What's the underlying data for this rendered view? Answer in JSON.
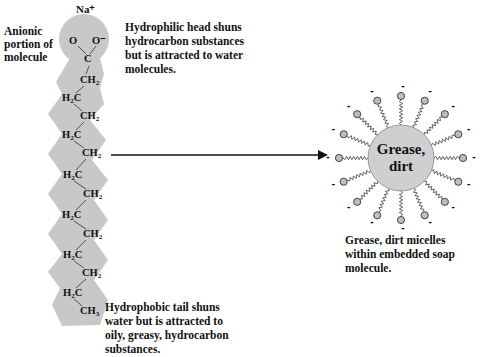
{
  "soap_molecule": {
    "cation": "Na⁺",
    "anionic_label": [
      "Anionic",
      "portion of",
      "molecule"
    ],
    "head_atoms": {
      "o_left": "O",
      "o_right": "O⁻",
      "carbon": "C"
    },
    "chain": [
      {
        "text": "CH",
        "sub": "2",
        "x": 80,
        "y": 74
      },
      {
        "text": "H",
        "sub": "2",
        "tail": "C",
        "x": 62,
        "y": 92
      },
      {
        "text": "CH",
        "sub": "2",
        "x": 80,
        "y": 110
      },
      {
        "text": "H",
        "sub": "2",
        "tail": "C",
        "x": 62,
        "y": 129
      },
      {
        "text": "CH",
        "sub": "2",
        "x": 82,
        "y": 147
      },
      {
        "text": "H",
        "sub": "2",
        "tail": "C",
        "x": 63,
        "y": 169
      },
      {
        "text": "CH",
        "sub": "2",
        "x": 83,
        "y": 188
      },
      {
        "text": "H",
        "sub": "2",
        "tail": "C",
        "x": 62,
        "y": 209
      },
      {
        "text": "CH",
        "sub": "2",
        "x": 83,
        "y": 228
      },
      {
        "text": "H",
        "sub": "2",
        "tail": "C",
        "x": 63,
        "y": 249
      },
      {
        "text": "CH",
        "sub": "2",
        "x": 82,
        "y": 267
      },
      {
        "text": "H",
        "sub": "2",
        "tail": "C",
        "x": 63,
        "y": 287
      },
      {
        "text": "CH",
        "sub": "3",
        "x": 80,
        "y": 305
      }
    ],
    "head_description": [
      "Hydrophilic head shuns",
      "hydrocarbon substances",
      "but is attracted to water",
      "molecules."
    ],
    "tail_description": [
      "Hydrophobic tail shuns",
      "water but is attracted to",
      "oily, greasy, hydrocarbon",
      "substances."
    ]
  },
  "micelle": {
    "core_label": [
      "Grease,",
      "dirt"
    ],
    "charge_symbol": "-",
    "head_count": 16,
    "caption": [
      "Grease, dirt micelles",
      "within embedded soap",
      "molecule."
    ]
  },
  "colors": {
    "molecule_fill": "#c8c8c8",
    "core_fill": "#cfcfcf",
    "head_fill": "#bdbdbd",
    "stroke": "#222222"
  }
}
